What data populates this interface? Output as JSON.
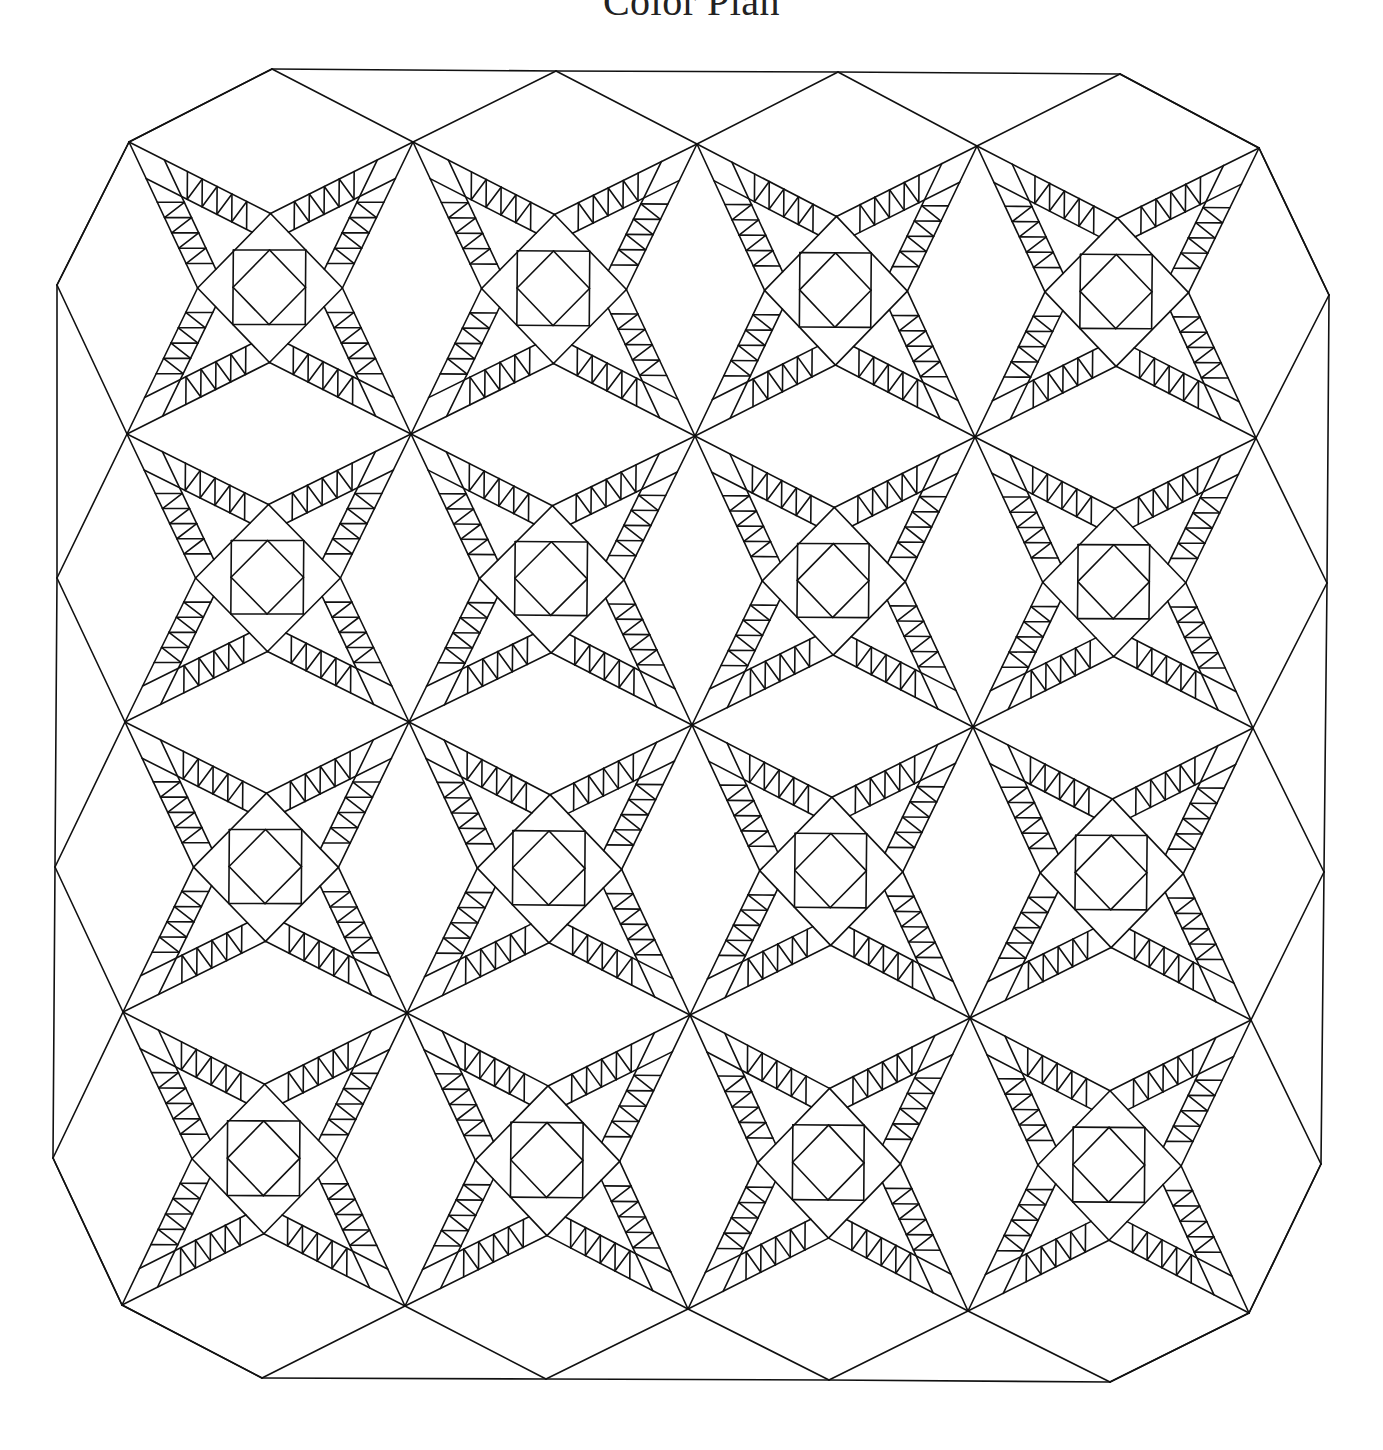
{
  "page": {
    "title": "Color Plan"
  },
  "diagram": {
    "type": "quilt-line-drawing",
    "line_color": "#111111",
    "background": "#ffffff",
    "rows": 4,
    "cols": 4,
    "grid_vertices": [
      [
        [
          129,
          142
        ],
        [
          413,
          142
        ],
        [
          697,
          144
        ],
        [
          977,
          146
        ],
        [
          1259,
          148
        ]
      ],
      [
        [
          127,
          434
        ],
        [
          411,
          434
        ],
        [
          695,
          436
        ],
        [
          975,
          437
        ],
        [
          1256,
          438
        ]
      ],
      [
        [
          125,
          722
        ],
        [
          409,
          722
        ],
        [
          692,
          725
        ],
        [
          973,
          727
        ],
        [
          1253,
          728
        ]
      ],
      [
        [
          123,
          1012
        ],
        [
          407,
          1013
        ],
        [
          690,
          1015
        ],
        [
          970,
          1018
        ],
        [
          1251,
          1020
        ]
      ],
      [
        [
          122,
          1305
        ],
        [
          405,
          1306
        ],
        [
          688,
          1309
        ],
        [
          968,
          1311
        ],
        [
          1249,
          1313
        ]
      ]
    ],
    "border": {
      "top_points": [
        [
          272,
          69
        ],
        [
          556,
          71
        ],
        [
          838,
          72
        ],
        [
          1120,
          74
        ]
      ],
      "bottom_points": [
        [
          262,
          1378
        ],
        [
          546,
          1379
        ],
        [
          829,
          1380
        ],
        [
          1110,
          1382
        ]
      ],
      "left_points": [
        [
          57,
          285
        ],
        [
          57,
          578
        ],
        [
          55,
          867
        ],
        [
          53,
          1158
        ]
      ],
      "right_points": [
        [
          1329,
          295
        ],
        [
          1327,
          583
        ],
        [
          1324,
          872
        ],
        [
          1321,
          1164
        ]
      ]
    },
    "block": {
      "sawtooth_units_per_arm": 4,
      "center": "square-in-a-square",
      "star_points": 4
    }
  }
}
